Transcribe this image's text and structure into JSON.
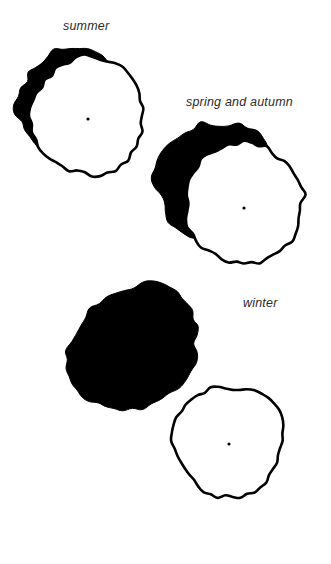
{
  "figure": {
    "kind": "tree-canopy-shadow-diagram",
    "background_color": "#ffffff",
    "ink_color": "#000000",
    "label_color": "#2b2b2b",
    "width": 331,
    "height": 564
  },
  "labels": {
    "summer": "summer",
    "spring_and_autumn": "spring and autumn",
    "winter": "winter"
  },
  "chart_data": {
    "type": "diagram",
    "title": "",
    "groups": [
      {
        "name": "summer",
        "label": "summer",
        "label_x": 63,
        "label_y": 20,
        "canopy": {
          "cx": 88,
          "cy": 116,
          "rx": 57,
          "ry": 59,
          "fill": "#ffffff",
          "stroke": "#000000",
          "stroke_width": 2.6,
          "roughness": 0.055,
          "lobes": 46,
          "seed": 11
        },
        "center_dot": {
          "cx": 88,
          "cy": 119,
          "r": 1.6,
          "fill": "#000000"
        },
        "shadow": {
          "cx": 76,
          "cy": 104,
          "rx": 57,
          "ry": 57,
          "fill": "#000000",
          "roughness": 0.075,
          "lobes": 42,
          "seed": 29,
          "rotate": -18
        },
        "shadow_extent": "small crescent to the upper-left of the canopy"
      },
      {
        "name": "spring_and_autumn",
        "label": "spring and autumn",
        "label_x": 186,
        "label_y": 96,
        "canopy": {
          "cx": 244,
          "cy": 203,
          "rx": 59,
          "ry": 61,
          "fill": "#ffffff",
          "stroke": "#000000",
          "stroke_width": 2.6,
          "roughness": 0.05,
          "lobes": 48,
          "seed": 7
        },
        "center_dot": {
          "cx": 244,
          "cy": 208,
          "r": 1.6,
          "fill": "#000000"
        },
        "shadow": {
          "cx": 216,
          "cy": 180,
          "rx": 60,
          "ry": 58,
          "fill": "#000000",
          "roughness": 0.085,
          "lobes": 40,
          "seed": 53,
          "rotate": -24
        },
        "shadow_extent": "broad crescent offset further up and to the left"
      },
      {
        "name": "winter",
        "label": "winter",
        "label_x": 243,
        "label_y": 297,
        "canopy": {
          "cx": 229,
          "cy": 441,
          "rx": 55,
          "ry": 57,
          "fill": "#ffffff",
          "stroke": "#000000",
          "stroke_width": 2.6,
          "roughness": 0.05,
          "lobes": 46,
          "seed": 3
        },
        "center_dot": {
          "cx": 229,
          "cy": 444,
          "r": 1.6,
          "fill": "#000000"
        },
        "shadow": {
          "cx": 133,
          "cy": 347,
          "rx": 72,
          "ry": 58,
          "fill": "#000000",
          "roughness": 0.06,
          "lobes": 44,
          "seed": 91,
          "rotate": -38
        },
        "shadow_extent": "large solid ellipse displaced far to the upper-left, detached from the canopy"
      }
    ]
  }
}
